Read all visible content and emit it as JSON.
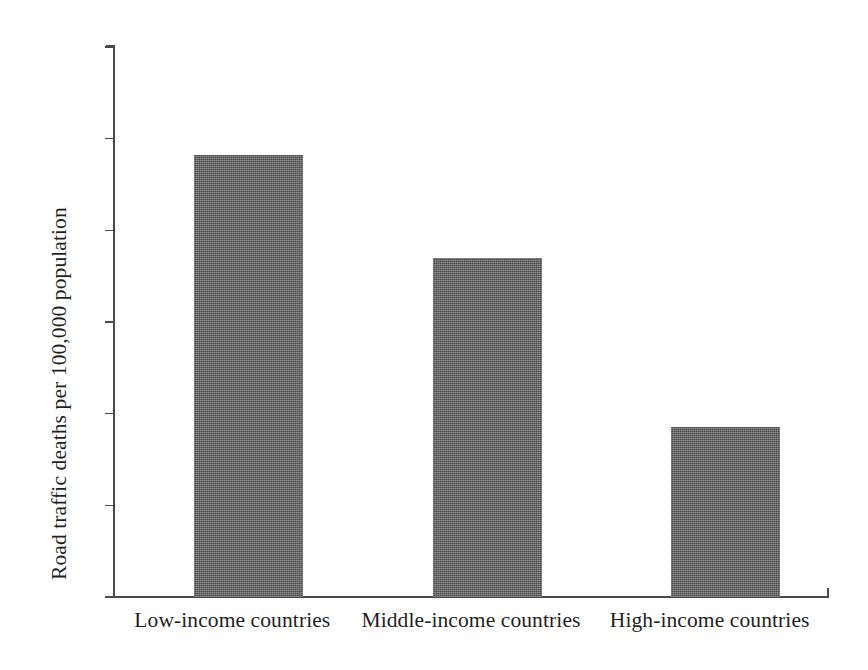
{
  "chart_data": {
    "type": "bar",
    "title": "",
    "subtitle": "",
    "xlabel": "",
    "ylabel": "Road traffic deaths per 100,000 population",
    "categories": [
      "Low-income countries",
      "Middle-income countries",
      "High-income countries"
    ],
    "values": [
      24.1,
      18.5,
      9.3
    ],
    "ylim": [
      0,
      30
    ],
    "yticks": [
      0,
      5,
      10,
      15,
      20,
      25,
      30
    ],
    "ytick_labels": [
      "0",
      "5",
      "10",
      "15",
      "20",
      "25",
      "30"
    ],
    "grid": false,
    "legend": null,
    "legend_position": "none",
    "bar_color": "#5b5b5b",
    "axis_color": "#4a4a4a",
    "background_color": "#ffffff",
    "annotations": []
  },
  "axis": {
    "y_title": "Road traffic deaths per 100,000 population"
  }
}
